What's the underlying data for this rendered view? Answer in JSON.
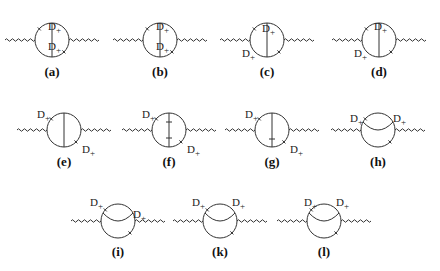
{
  "figure": {
    "diagrams": [
      {
        "id": "a",
        "caption": "(a)",
        "cx": 52,
        "cy": 40,
        "type": "vertical",
        "labels": [
          {
            "text": "D",
            "sub": "+",
            "dx": -4,
            "dy": -10
          },
          {
            "text": "D",
            "sub": "+",
            "dx": -4,
            "dy": 10
          }
        ]
      },
      {
        "id": "b",
        "caption": "(b)",
        "cx": 160,
        "cy": 40,
        "type": "vertical",
        "labels": [
          {
            "text": "D",
            "sub": "+",
            "dx": -4,
            "dy": -10
          },
          {
            "text": "D",
            "sub": "+",
            "dx": -4,
            "dy": 10
          }
        ]
      },
      {
        "id": "c",
        "caption": "(c)",
        "cx": 267,
        "cy": 40,
        "type": "vertical",
        "labels": [
          {
            "text": "D",
            "sub": "+",
            "dx": -5,
            "dy": -8
          },
          {
            "text": "D",
            "sub": "+",
            "dx": -25,
            "dy": 17
          }
        ]
      },
      {
        "id": "d",
        "caption": "(d)",
        "cx": 379,
        "cy": 40,
        "type": "vertical",
        "labels": [
          {
            "text": "D",
            "sub": "+",
            "dx": -5,
            "dy": -10
          },
          {
            "text": "D",
            "sub": "+",
            "dx": -25,
            "dy": 17
          }
        ]
      },
      {
        "id": "e",
        "caption": "(e)",
        "cx": 64,
        "cy": 130,
        "type": "vertical",
        "labels": [
          {
            "text": "D",
            "sub": "+",
            "dx": -27,
            "dy": -12
          },
          {
            "text": "D",
            "sub": "+",
            "dx": 18,
            "dy": 23
          }
        ]
      },
      {
        "id": "f",
        "caption": "(f)",
        "cx": 169,
        "cy": 130,
        "type": "vertical-bars",
        "labels": [
          {
            "text": "D",
            "sub": "+",
            "dx": -27,
            "dy": -12
          },
          {
            "text": "D",
            "sub": "+",
            "dx": 18,
            "dy": 23
          }
        ]
      },
      {
        "id": "g",
        "caption": "(g)",
        "cx": 272,
        "cy": 130,
        "type": "vertical-bar",
        "labels": [
          {
            "text": "D",
            "sub": "+",
            "dx": -27,
            "dy": -12
          },
          {
            "text": "D",
            "sub": "+",
            "dx": 18,
            "dy": 23
          }
        ]
      },
      {
        "id": "h",
        "caption": "(h)",
        "cx": 378,
        "cy": 130,
        "type": "arc",
        "labels": [
          {
            "text": "D",
            "sub": "+",
            "dx": -28,
            "dy": -8
          },
          {
            "text": "D",
            "sub": "+",
            "dx": 15,
            "dy": -8
          }
        ]
      },
      {
        "id": "i",
        "caption": "(i)",
        "cx": 118,
        "cy": 221,
        "type": "arc",
        "labels": [
          {
            "text": "D",
            "sub": "+",
            "dx": -28,
            "dy": -15
          },
          {
            "text": "D",
            "sub": "+",
            "dx": 15,
            "dy": -3
          }
        ]
      },
      {
        "id": "k",
        "caption": "(k)",
        "cx": 220,
        "cy": 221,
        "type": "arc",
        "labels": [
          {
            "text": "D",
            "sub": "+",
            "dx": -28,
            "dy": -15
          },
          {
            "text": "D",
            "sub": "+",
            "dx": 12,
            "dy": -15
          }
        ]
      },
      {
        "id": "l",
        "caption": "(l)",
        "cx": 324,
        "cy": 221,
        "type": "arc",
        "labels": [
          {
            "text": "D",
            "sub": "+",
            "dx": -20,
            "dy": -15
          },
          {
            "text": "D",
            "sub": "+",
            "dx": 12,
            "dy": -15
          }
        ]
      }
    ]
  },
  "captions": {
    "a": "(a)",
    "b": "(b)",
    "c": "(c)",
    "d": "(d)",
    "e": "(e)",
    "f": "(f)",
    "g": "(g)",
    "h": "(h)",
    "i": "(i)",
    "k": "(k)",
    "l": "(l)"
  }
}
